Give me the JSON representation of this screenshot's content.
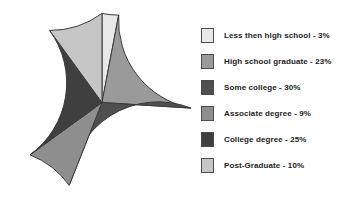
{
  "chart_data": {
    "type": "pie",
    "title": "",
    "categories": [
      "Less then high school",
      "High school graduate",
      "Some college",
      "Associate degree",
      "College degree",
      "Post-Graduate"
    ],
    "values": [
      3,
      23,
      30,
      9,
      25,
      10
    ],
    "value_unit": "%",
    "legend_position": "right",
    "grid": false,
    "start_angle_deg": 90,
    "direction": "counterclockwise",
    "slice_colors": [
      "#e8e8e8",
      "#9a9a9a",
      "#4f4f4f",
      "#8e8e8e",
      "#3f3f3f",
      "#c6c6c6"
    ],
    "outline_color": "#3a3a3a",
    "legend": [
      {
        "label": "Less then high school - 3%",
        "color": "#e8e8e8",
        "value": 3,
        "name": "Less then high school"
      },
      {
        "label": "High school graduate - 23%",
        "color": "#9a9a9a",
        "value": 23,
        "name": "High school graduate"
      },
      {
        "label": "Some college - 30%",
        "color": "#4f4f4f",
        "value": 30,
        "name": "Some college"
      },
      {
        "label": "Associate degree - 9%",
        "color": "#8e8e8e",
        "value": 9,
        "name": "Associate degree"
      },
      {
        "label": "College degree - 25%",
        "color": "#3f3f3f",
        "value": 25,
        "name": "College degree"
      },
      {
        "label": "Post-Graduate - 10%",
        "color": "#c6c6c6",
        "value": 10,
        "name": "Post-Graduate"
      }
    ]
  }
}
